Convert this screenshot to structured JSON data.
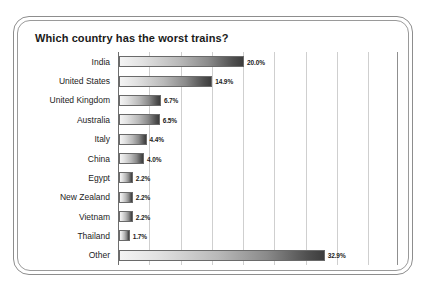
{
  "chart_data": {
    "type": "bar",
    "orientation": "horizontal",
    "title": "Which country has the worst trains?",
    "xlabel": "",
    "ylabel": "",
    "xlim": [
      0,
      40
    ],
    "grid": "vertical",
    "legend": "none",
    "value_suffix": "%",
    "gridline_step": 5,
    "categories": [
      "India",
      "United States",
      "United Kingdom",
      "Australia",
      "Italy",
      "China",
      "Egypt",
      "New Zealand",
      "Vietnam",
      "Thailand",
      "Other"
    ],
    "values": [
      20.0,
      14.9,
      6.7,
      6.5,
      4.4,
      4.0,
      2.2,
      2.2,
      2.2,
      1.7,
      32.9
    ],
    "value_labels": [
      "20.0%",
      "14.9%",
      "6.7%",
      "6.5%",
      "4.4%",
      "4.0%",
      "2.2%",
      "2.2%",
      "2.2%",
      "1.7%",
      "32.9%"
    ]
  },
  "style": {
    "bar_gradient_start": "#f4f4f4",
    "bar_gradient_end": "#3d3d3d",
    "bar_border": "#6a6a6a",
    "gridline_color": "#cfcfcf",
    "axis_color": "#6e6e6e",
    "frame_color": "#8d8d8d",
    "background": "#ffffff",
    "text_color": "#1c1c1c"
  }
}
